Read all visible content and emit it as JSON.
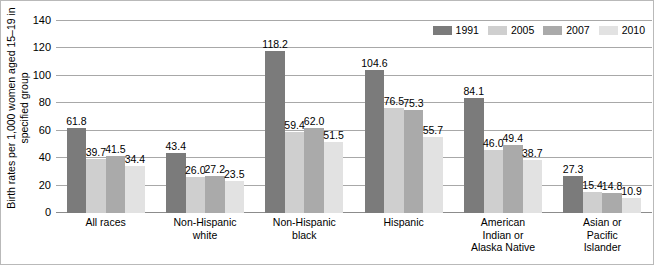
{
  "chart_data": {
    "type": "bar",
    "title": "",
    "subtitle": "",
    "xlabel": "",
    "ylabel_lines": [
      "Birth rates per 1,000 women aged 15–19 in",
      "specified group"
    ],
    "ylabel": "Birth rates per 1,000 women aged 15–19 in specified group",
    "ylim": [
      0,
      140
    ],
    "yticks": [
      0,
      20,
      40,
      60,
      80,
      100,
      120,
      140
    ],
    "ytick_labels": [
      "0",
      "20",
      "40",
      "60",
      "80",
      "100",
      "120",
      "140"
    ],
    "grid": true,
    "legend_position": "top-right",
    "categories": [
      "All races",
      "Non-Hispanic white",
      "Non-Hispanic black",
      "Hispanic",
      "American Indian or Alaska Native",
      "Asian or Pacific Islander"
    ],
    "category_label_lines": [
      [
        "All races"
      ],
      [
        "Non-Hispanic",
        "white"
      ],
      [
        "Non-Hispanic",
        "black"
      ],
      [
        "Hispanic"
      ],
      [
        "American",
        "Indian or",
        "Alaska Native"
      ],
      [
        "Asian or",
        "Pacific",
        "Islander"
      ]
    ],
    "series": [
      {
        "name": "1991",
        "color": "#7b7b7b",
        "values": [
          61.8,
          43.4,
          118.2,
          104.6,
          84.1,
          27.3
        ],
        "value_labels": [
          "61.8",
          "43.4",
          "118.2",
          "104.6",
          "84.1",
          "27.3"
        ]
      },
      {
        "name": "2005",
        "color": "#cfcfcf",
        "values": [
          39.7,
          26.0,
          59.4,
          76.5,
          46.0,
          15.4
        ],
        "value_labels": [
          "39.7",
          "26.0",
          "59.4",
          "76.5",
          "46.0",
          "15.4"
        ]
      },
      {
        "name": "2007",
        "color": "#aaaaaa",
        "values": [
          41.5,
          27.2,
          62.0,
          75.3,
          49.4,
          14.8
        ],
        "value_labels": [
          "41.5",
          "27.2",
          "62.0",
          "75.3",
          "49.4",
          "14.8"
        ]
      },
      {
        "name": "2010",
        "color": "#e2e2e2",
        "values": [
          34.4,
          23.5,
          51.5,
          55.7,
          38.7,
          10.9
        ],
        "value_labels": [
          "34.4",
          "23.5",
          "51.5",
          "55.7",
          "38.7",
          "10.9"
        ]
      }
    ]
  }
}
